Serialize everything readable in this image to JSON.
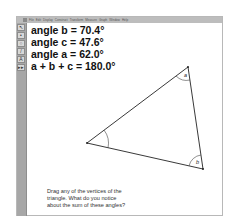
{
  "menubar": {
    "items": [
      "File",
      "Edit",
      "Display",
      "Construct",
      "Transform",
      "Measure",
      "Graph",
      "Window",
      "Help"
    ]
  },
  "toolbox": {
    "tools": [
      {
        "name": "selection-arrow-tool",
        "glyph": "↖"
      },
      {
        "name": "point-tool",
        "glyph": "•"
      },
      {
        "name": "compass-tool",
        "glyph": "○"
      },
      {
        "name": "straightedge-tool",
        "glyph": "/"
      },
      {
        "name": "text-tool",
        "glyph": "A"
      },
      {
        "name": "custom-tool",
        "glyph": "▸▸"
      }
    ]
  },
  "measurements": [
    {
      "label": "angle b = 70.4°"
    },
    {
      "label": "angle c = 47.6°"
    },
    {
      "label": "angle a = 62.0°"
    },
    {
      "label": "a + b + c = 180.0°"
    }
  ],
  "triangle": {
    "vertices": {
      "a": {
        "x": 188,
        "y": 67
      },
      "c": {
        "x": 87,
        "y": 143
      },
      "b": {
        "x": 203,
        "y": 169
      }
    },
    "angle_labels": [
      "a",
      "b"
    ],
    "stroke_color": "#222222"
  },
  "prompt": {
    "lines": [
      "Drag any of the vertices of the",
      "triangle. What do you notice",
      "about the sum of these angles?"
    ]
  }
}
